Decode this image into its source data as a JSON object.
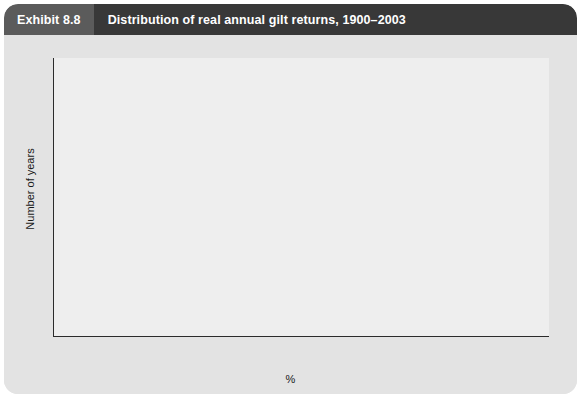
{
  "exhibit": {
    "number_label": "Exhibit 8.8",
    "title": "Distribution of real annual gilt returns, 1900–2003"
  },
  "colors": {
    "card_background": "#e3e3e3",
    "plot_background": "#eeeeee",
    "bar": "#4f4f4f",
    "axis": "#2b2b2b",
    "number_block": "#5b5b5b",
    "title_block": "#383838",
    "title_text": "#ffffff"
  },
  "chart_data": {
    "type": "bar",
    "title": "Distribution of real annual gilt returns, 1900–2003",
    "subtitle": "",
    "xlabel": "%",
    "ylabel": "Number of years",
    "xlim": [
      -50,
      60
    ],
    "ylim": [
      0,
      12
    ],
    "grid": false,
    "legend": "none",
    "bin_width": 2,
    "y_ticks": [
      0,
      2,
      4,
      6,
      8,
      10,
      12
    ],
    "x_tick_labels": [
      "-50",
      "-46",
      "-42",
      "-38",
      "-34",
      "-30",
      "-26",
      "-22",
      "-18",
      "-14",
      "-10",
      "-6",
      "-2",
      "2",
      "6",
      "10",
      "14",
      "18",
      "22",
      "26",
      "30",
      "34",
      "38",
      "42",
      "46",
      "50",
      "54",
      "58"
    ],
    "x_tick_label_step": 4,
    "minor_tick_step": 2,
    "categories": [
      "-50",
      "-48",
      "-46",
      "-44",
      "-42",
      "-40",
      "-38",
      "-36",
      "-34",
      "-32",
      "-30",
      "-28",
      "-26",
      "-24",
      "-22",
      "-20",
      "-18",
      "-16",
      "-14",
      "-12",
      "-10",
      "-8",
      "-6",
      "-4",
      "-2",
      "0",
      "2",
      "4",
      "6",
      "8",
      "10",
      "12",
      "14",
      "16",
      "18",
      "20",
      "22",
      "24",
      "26",
      "28",
      "30",
      "32",
      "34",
      "36",
      "38",
      "40",
      "42",
      "44",
      "46",
      "48",
      "50",
      "52",
      "54",
      "56",
      "58"
    ],
    "values": [
      0,
      0,
      0,
      0,
      0,
      0,
      0,
      0,
      0,
      0,
      1,
      0,
      0,
      1,
      0,
      0,
      1,
      3,
      3,
      2,
      5,
      5,
      4,
      4,
      9,
      9,
      10,
      10,
      8,
      5,
      1,
      2,
      5,
      4,
      1,
      0,
      3,
      0,
      0,
      2,
      2,
      0,
      0,
      0,
      0,
      0,
      0,
      1,
      1,
      0,
      0,
      0,
      0,
      0,
      1
    ]
  }
}
